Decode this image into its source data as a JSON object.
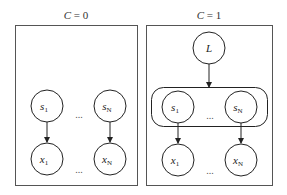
{
  "panels": [
    {
      "title": "C = 0",
      "title_var": "C",
      "title_val": "= 0",
      "nodes": {
        "s1": {
          "base": "s",
          "sub": "1"
        },
        "sN": {
          "base": "s",
          "sub": "N"
        },
        "x1": {
          "base": "x",
          "sub": "1"
        },
        "xN": {
          "base": "x",
          "sub": "N"
        }
      },
      "ellipsis": "..."
    },
    {
      "title": "C = 1",
      "title_var": "C",
      "title_val": "= 1",
      "latent": {
        "label": "L"
      },
      "nodes": {
        "s1": {
          "base": "s",
          "sub": "1"
        },
        "sN": {
          "base": "s",
          "sub": "N"
        },
        "x1": {
          "base": "x",
          "sub": "1"
        },
        "xN": {
          "base": "x",
          "sub": "N"
        }
      },
      "ellipsis": "..."
    }
  ],
  "colors": {
    "stroke": "#222222",
    "frame": "#555555"
  }
}
